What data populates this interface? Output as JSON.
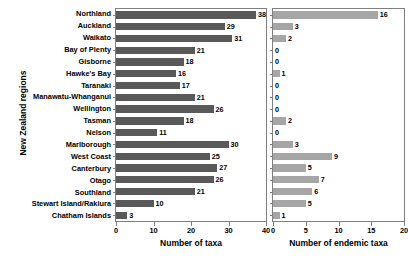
{
  "chart_data": {
    "type": "bar",
    "orientation": "horizontal",
    "title": "",
    "ylabel": "New Zealand regions",
    "grid": false,
    "legend": "none",
    "categories": [
      "Northland",
      "Auckland",
      "Waikato",
      "Bay of Plenty",
      "Gisborne",
      "Hawke's Bay",
      "Taranaki",
      "Manawatu-Whanganui",
      "Wellington",
      "Tasman",
      "Nelson",
      "Marlborough",
      "West Coast",
      "Canterbury",
      "Otago",
      "Southland",
      "Stewart Island/Rakiura",
      "Chatham Islands"
    ],
    "panels": [
      {
        "name": "total-taxa",
        "xlabel": "Number of taxa",
        "xlim": [
          0,
          40
        ],
        "xticks": [
          0,
          10,
          20,
          30,
          40
        ],
        "bar_color": "#595959",
        "values": [
          38,
          29,
          31,
          21,
          18,
          16,
          17,
          21,
          26,
          18,
          11,
          30,
          25,
          27,
          26,
          21,
          10,
          3
        ]
      },
      {
        "name": "endemic-taxa",
        "xlabel": "Number of endemic taxa",
        "xlim": [
          0,
          20
        ],
        "xticks": [
          0,
          5,
          10,
          15,
          20
        ],
        "bar_color": "#a6a6a6",
        "values": [
          16,
          3,
          2,
          0,
          0,
          1,
          0,
          0,
          0,
          2,
          0,
          3,
          9,
          5,
          7,
          6,
          5,
          1
        ]
      }
    ]
  }
}
